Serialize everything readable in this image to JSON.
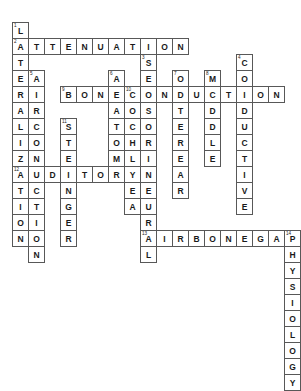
{
  "puzzle": {
    "title": "Audiology Crossword Grid",
    "cell_size": 17,
    "origin_x": 12,
    "origin_y": 22,
    "grid_cols": 16,
    "grid_rows": 18,
    "colors": {
      "cell_border": "#585858",
      "cell_fill": "#ffffff",
      "letter": "#1a1a1a",
      "page_background": "#ffffff"
    },
    "entries": {
      "across": [
        {
          "number": "2",
          "answer": "ATTENUATION",
          "row": 1,
          "col": 0
        },
        {
          "number": "9",
          "answer": "BONECONDUCTION",
          "row": 3,
          "col": 3
        },
        {
          "number": "12",
          "answer": "AUDITORY",
          "row": 7,
          "col": 0
        },
        {
          "number": "13",
          "answer": "AIRBONEGAP",
          "row": 10,
          "col": 7
        }
      ],
      "down": [
        {
          "number": "1",
          "answer": "L",
          "row": 0,
          "col": 0
        },
        {
          "number": "2",
          "answer": "ATERALIZATION",
          "row": 1,
          "col": 0
        },
        {
          "number": "3",
          "answer": "SENSORINEURAL",
          "row": 2,
          "col": 8
        },
        {
          "number": "4",
          "answer": "CONDUCTIVE",
          "row": 2,
          "col": 14
        },
        {
          "number": "5",
          "answer": "AIRCONDUCTION",
          "row": 3,
          "col": 1
        },
        {
          "number": "6",
          "answer": "ANATOMY",
          "row": 3,
          "col": 6
        },
        {
          "number": "7",
          "answer": "OUTEREAR",
          "row": 3,
          "col": 10
        },
        {
          "number": "8",
          "answer": "MIDDLE",
          "row": 3,
          "col": 12
        },
        {
          "number": "10",
          "answer": "COCHLEA",
          "row": 4,
          "col": 7
        },
        {
          "number": "11",
          "answer": "STENGER",
          "row": 6,
          "col": 3
        },
        {
          "number": "14",
          "answer": "PHYSIOLOGY",
          "row": 10,
          "col": 15
        }
      ]
    },
    "cells": [
      {
        "row": 0,
        "col": 0,
        "letter": "L",
        "num": "1"
      },
      {
        "row": 1,
        "col": 0,
        "letter": "A",
        "num": "2"
      },
      {
        "row": 1,
        "col": 1,
        "letter": "T",
        "num": ""
      },
      {
        "row": 1,
        "col": 2,
        "letter": "T",
        "num": ""
      },
      {
        "row": 1,
        "col": 3,
        "letter": "E",
        "num": ""
      },
      {
        "row": 1,
        "col": 4,
        "letter": "N",
        "num": ""
      },
      {
        "row": 1,
        "col": 5,
        "letter": "U",
        "num": ""
      },
      {
        "row": 1,
        "col": 6,
        "letter": "A",
        "num": ""
      },
      {
        "row": 1,
        "col": 7,
        "letter": "T",
        "num": ""
      },
      {
        "row": 1,
        "col": 8,
        "letter": "I",
        "num": ""
      },
      {
        "row": 1,
        "col": 9,
        "letter": "O",
        "num": ""
      },
      {
        "row": 1,
        "col": 10,
        "letter": "N",
        "num": ""
      },
      {
        "row": 2,
        "col": 0,
        "letter": "T",
        "num": ""
      },
      {
        "row": 2,
        "col": 8,
        "letter": "S",
        "num": "3"
      },
      {
        "row": 2,
        "col": 14,
        "letter": "C",
        "num": "4"
      },
      {
        "row": 3,
        "col": 0,
        "letter": "E",
        "num": ""
      },
      {
        "row": 3,
        "col": 1,
        "letter": "A",
        "num": "5"
      },
      {
        "row": 3,
        "col": 6,
        "letter": "A",
        "num": "6"
      },
      {
        "row": 3,
        "col": 8,
        "letter": "E",
        "num": ""
      },
      {
        "row": 3,
        "col": 10,
        "letter": "O",
        "num": "7"
      },
      {
        "row": 3,
        "col": 12,
        "letter": "M",
        "num": "8"
      },
      {
        "row": 3,
        "col": 14,
        "letter": "O",
        "num": ""
      },
      {
        "row": 4,
        "col": 0,
        "letter": "R",
        "num": ""
      },
      {
        "row": 4,
        "col": 1,
        "letter": "I",
        "num": ""
      },
      {
        "row": 4,
        "col": 3,
        "letter": "B",
        "num": "9"
      },
      {
        "row": 4,
        "col": 4,
        "letter": "O",
        "num": ""
      },
      {
        "row": 4,
        "col": 5,
        "letter": "N",
        "num": ""
      },
      {
        "row": 4,
        "col": 6,
        "letter": "E",
        "num": ""
      },
      {
        "row": 4,
        "col": 7,
        "letter": "C",
        "num": "10"
      },
      {
        "row": 4,
        "col": 8,
        "letter": "O",
        "num": ""
      },
      {
        "row": 4,
        "col": 9,
        "letter": "N",
        "num": ""
      },
      {
        "row": 4,
        "col": 10,
        "letter": "D",
        "num": ""
      },
      {
        "row": 4,
        "col": 11,
        "letter": "U",
        "num": ""
      },
      {
        "row": 4,
        "col": 12,
        "letter": "C",
        "num": ""
      },
      {
        "row": 4,
        "col": 13,
        "letter": "T",
        "num": ""
      },
      {
        "row": 4,
        "col": 14,
        "letter": "I",
        "num": ""
      },
      {
        "row": 4,
        "col": 15,
        "letter": "O",
        "num": ""
      },
      {
        "row": 4,
        "col": 16,
        "letter": "N",
        "num": ""
      },
      {
        "row": 5,
        "col": 0,
        "letter": "A",
        "num": ""
      },
      {
        "row": 5,
        "col": 1,
        "letter": "R",
        "num": ""
      },
      {
        "row": 5,
        "col": 6,
        "letter": "A",
        "num": ""
      },
      {
        "row": 5,
        "col": 7,
        "letter": "O",
        "num": ""
      },
      {
        "row": 5,
        "col": 8,
        "letter": "S",
        "num": ""
      },
      {
        "row": 5,
        "col": 10,
        "letter": "T",
        "num": ""
      },
      {
        "row": 5,
        "col": 12,
        "letter": "D",
        "num": ""
      },
      {
        "row": 5,
        "col": 14,
        "letter": "D",
        "num": ""
      },
      {
        "row": 6,
        "col": 0,
        "letter": "L",
        "num": ""
      },
      {
        "row": 6,
        "col": 1,
        "letter": "C",
        "num": ""
      },
      {
        "row": 6,
        "col": 3,
        "letter": "S",
        "num": "11"
      },
      {
        "row": 6,
        "col": 6,
        "letter": "T",
        "num": ""
      },
      {
        "row": 6,
        "col": 7,
        "letter": "C",
        "num": ""
      },
      {
        "row": 6,
        "col": 8,
        "letter": "O",
        "num": ""
      },
      {
        "row": 6,
        "col": 10,
        "letter": "E",
        "num": ""
      },
      {
        "row": 6,
        "col": 12,
        "letter": "D",
        "num": ""
      },
      {
        "row": 6,
        "col": 14,
        "letter": "U",
        "num": ""
      },
      {
        "row": 7,
        "col": 0,
        "letter": "I",
        "num": ""
      },
      {
        "row": 7,
        "col": 1,
        "letter": "O",
        "num": ""
      },
      {
        "row": 7,
        "col": 3,
        "letter": "T",
        "num": ""
      },
      {
        "row": 7,
        "col": 6,
        "letter": "O",
        "num": ""
      },
      {
        "row": 7,
        "col": 7,
        "letter": "H",
        "num": ""
      },
      {
        "row": 7,
        "col": 8,
        "letter": "R",
        "num": ""
      },
      {
        "row": 7,
        "col": 10,
        "letter": "R",
        "num": ""
      },
      {
        "row": 7,
        "col": 12,
        "letter": "L",
        "num": ""
      },
      {
        "row": 7,
        "col": 14,
        "letter": "C",
        "num": ""
      },
      {
        "row": 8,
        "col": 0,
        "letter": "Z",
        "num": ""
      },
      {
        "row": 8,
        "col": 1,
        "letter": "N",
        "num": ""
      },
      {
        "row": 8,
        "col": 3,
        "letter": "E",
        "num": ""
      },
      {
        "row": 8,
        "col": 6,
        "letter": "M",
        "num": ""
      },
      {
        "row": 8,
        "col": 7,
        "letter": "L",
        "num": ""
      },
      {
        "row": 8,
        "col": 8,
        "letter": "I",
        "num": ""
      },
      {
        "row": 8,
        "col": 10,
        "letter": "E",
        "num": ""
      },
      {
        "row": 8,
        "col": 12,
        "letter": "E",
        "num": ""
      },
      {
        "row": 8,
        "col": 14,
        "letter": "T",
        "num": ""
      },
      {
        "row": 9,
        "col": 0,
        "letter": "A",
        "num": "12"
      },
      {
        "row": 9,
        "col": 1,
        "letter": "U",
        "num": ""
      },
      {
        "row": 9,
        "col": 2,
        "letter": "D",
        "num": ""
      },
      {
        "row": 9,
        "col": 3,
        "letter": "I",
        "num": ""
      },
      {
        "row": 9,
        "col": 4,
        "letter": "T",
        "num": ""
      },
      {
        "row": 9,
        "col": 5,
        "letter": "O",
        "num": ""
      },
      {
        "row": 9,
        "col": 6,
        "letter": "R",
        "num": ""
      },
      {
        "row": 9,
        "col": 7,
        "letter": "Y",
        "num": ""
      },
      {
        "row": 9,
        "col": 8,
        "letter": "N",
        "num": ""
      },
      {
        "row": 9,
        "col": 10,
        "letter": "A",
        "num": ""
      },
      {
        "row": 9,
        "col": 14,
        "letter": "I",
        "num": ""
      },
      {
        "row": 10,
        "col": 0,
        "letter": "T",
        "num": ""
      },
      {
        "row": 10,
        "col": 1,
        "letter": "C",
        "num": ""
      },
      {
        "row": 10,
        "col": 3,
        "letter": "N",
        "num": ""
      },
      {
        "row": 10,
        "col": 7,
        "letter": "E",
        "num": ""
      },
      {
        "row": 10,
        "col": 8,
        "letter": "E",
        "num": ""
      },
      {
        "row": 10,
        "col": 10,
        "letter": "R",
        "num": ""
      },
      {
        "row": 10,
        "col": 14,
        "letter": "V",
        "num": ""
      },
      {
        "row": 11,
        "col": 0,
        "letter": "I",
        "num": ""
      },
      {
        "row": 11,
        "col": 1,
        "letter": "T",
        "num": ""
      },
      {
        "row": 11,
        "col": 3,
        "letter": "G",
        "num": ""
      },
      {
        "row": 11,
        "col": 7,
        "letter": "A",
        "num": ""
      },
      {
        "row": 11,
        "col": 8,
        "letter": "U",
        "num": ""
      },
      {
        "row": 11,
        "col": 14,
        "letter": "E",
        "num": ""
      },
      {
        "row": 12,
        "col": 0,
        "letter": "O",
        "num": ""
      },
      {
        "row": 12,
        "col": 1,
        "letter": "I",
        "num": ""
      },
      {
        "row": 12,
        "col": 3,
        "letter": "E",
        "num": ""
      },
      {
        "row": 12,
        "col": 8,
        "letter": "R",
        "num": ""
      },
      {
        "row": 13,
        "col": 0,
        "letter": "N",
        "num": ""
      },
      {
        "row": 13,
        "col": 1,
        "letter": "O",
        "num": ""
      },
      {
        "row": 13,
        "col": 3,
        "letter": "R",
        "num": ""
      },
      {
        "row": 13,
        "col": 8,
        "letter": "A",
        "num": "13"
      },
      {
        "row": 13,
        "col": 9,
        "letter": "I",
        "num": ""
      },
      {
        "row": 13,
        "col": 10,
        "letter": "R",
        "num": ""
      },
      {
        "row": 13,
        "col": 11,
        "letter": "B",
        "num": ""
      },
      {
        "row": 13,
        "col": 12,
        "letter": "O",
        "num": ""
      },
      {
        "row": 13,
        "col": 13,
        "letter": "N",
        "num": ""
      },
      {
        "row": 13,
        "col": 14,
        "letter": "E",
        "num": ""
      },
      {
        "row": 13,
        "col": 15,
        "letter": "G",
        "num": ""
      },
      {
        "row": 13,
        "col": 16,
        "letter": "A",
        "num": ""
      },
      {
        "row": 13,
        "col": 17,
        "letter": "P",
        "num": "14"
      },
      {
        "row": 14,
        "col": 1,
        "letter": "N",
        "num": ""
      },
      {
        "row": 14,
        "col": 8,
        "letter": "L",
        "num": ""
      },
      {
        "row": 14,
        "col": 17,
        "letter": "H",
        "num": ""
      },
      {
        "row": 15,
        "col": 17,
        "letter": "Y",
        "num": ""
      },
      {
        "row": 16,
        "col": 17,
        "letter": "S",
        "num": ""
      },
      {
        "row": 17,
        "col": 17,
        "letter": "I",
        "num": ""
      },
      {
        "row": 18,
        "col": 17,
        "letter": "O",
        "num": ""
      },
      {
        "row": 19,
        "col": 17,
        "letter": "L",
        "num": ""
      },
      {
        "row": 20,
        "col": 17,
        "letter": "O",
        "num": ""
      },
      {
        "row": 21,
        "col": 17,
        "letter": "G",
        "num": ""
      },
      {
        "row": 22,
        "col": 17,
        "letter": "Y",
        "num": ""
      }
    ]
  }
}
